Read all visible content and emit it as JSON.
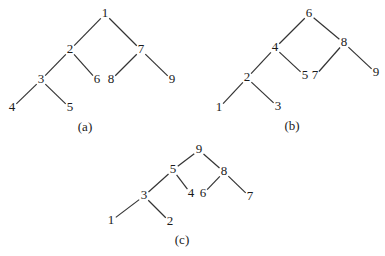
{
  "diagram": {
    "background": "#ffffff",
    "ink_color": "#1a1a1a",
    "trees": [
      {
        "id": "a",
        "caption": "(a)",
        "caption_pos": [
          85,
          128
        ],
        "nodes": [
          {
            "label": "1",
            "x": 105,
            "y": 14
          },
          {
            "label": "2",
            "x": 70,
            "y": 50
          },
          {
            "label": "7",
            "x": 141,
            "y": 50
          },
          {
            "label": "3",
            "x": 41,
            "y": 80
          },
          {
            "label": "6",
            "x": 97,
            "y": 80
          },
          {
            "label": "8",
            "x": 111,
            "y": 80
          },
          {
            "label": "9",
            "x": 172,
            "y": 80
          },
          {
            "label": "4",
            "x": 12,
            "y": 108
          },
          {
            "label": "5",
            "x": 70,
            "y": 108
          }
        ],
        "edges": [
          [
            "1",
            "2"
          ],
          [
            "1",
            "7"
          ],
          [
            "2",
            "3"
          ],
          [
            "2",
            "6"
          ],
          [
            "7",
            "8"
          ],
          [
            "7",
            "9"
          ],
          [
            "3",
            "4"
          ],
          [
            "3",
            "5"
          ]
        ]
      },
      {
        "id": "b",
        "caption": "(b)",
        "caption_pos": [
          292,
          127
        ],
        "nodes": [
          {
            "label": "6",
            "x": 309,
            "y": 14
          },
          {
            "label": "4",
            "x": 275,
            "y": 48
          },
          {
            "label": "8",
            "x": 344,
            "y": 43
          },
          {
            "label": "2",
            "x": 247,
            "y": 78
          },
          {
            "label": "5",
            "x": 305,
            "y": 76
          },
          {
            "label": "7",
            "x": 315,
            "y": 76
          },
          {
            "label": "9",
            "x": 376,
            "y": 73
          },
          {
            "label": "1",
            "x": 219,
            "y": 108
          },
          {
            "label": "3",
            "x": 278,
            "y": 107
          }
        ],
        "edges": [
          [
            "6",
            "4"
          ],
          [
            "6",
            "8"
          ],
          [
            "4",
            "2"
          ],
          [
            "4",
            "5"
          ],
          [
            "8",
            "7"
          ],
          [
            "8",
            "9"
          ],
          [
            "2",
            "1"
          ],
          [
            "2",
            "3"
          ]
        ]
      },
      {
        "id": "c",
        "caption": "(c)",
        "caption_pos": [
          182,
          241
        ],
        "nodes": [
          {
            "label": "9",
            "x": 199,
            "y": 150
          },
          {
            "label": "5",
            "x": 173,
            "y": 170
          },
          {
            "label": "8",
            "x": 224,
            "y": 172
          },
          {
            "label": "3",
            "x": 144,
            "y": 196
          },
          {
            "label": "4",
            "x": 191,
            "y": 194
          },
          {
            "label": "6",
            "x": 203,
            "y": 194
          },
          {
            "label": "7",
            "x": 250,
            "y": 197
          },
          {
            "label": "1",
            "x": 111,
            "y": 221
          },
          {
            "label": "2",
            "x": 170,
            "y": 222
          }
        ],
        "edges": [
          [
            "9",
            "5"
          ],
          [
            "9",
            "8"
          ],
          [
            "5",
            "3"
          ],
          [
            "5",
            "4"
          ],
          [
            "8",
            "6"
          ],
          [
            "8",
            "7"
          ],
          [
            "3",
            "1"
          ],
          [
            "3",
            "2"
          ]
        ]
      }
    ]
  }
}
